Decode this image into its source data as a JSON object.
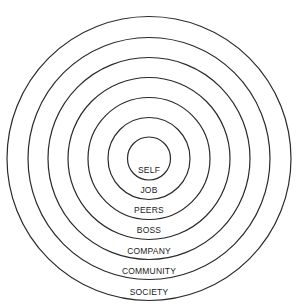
{
  "diagram": {
    "type": "concentric-circles",
    "center": {
      "x": 149,
      "y": 158.5
    },
    "rings": [
      {
        "label": "SELF",
        "radius": 21.5,
        "label_y": 173
      },
      {
        "label": "JOB",
        "radius": 41,
        "label_y": 193
      },
      {
        "label": "PEERS",
        "radius": 61,
        "label_y": 213
      },
      {
        "label": "BOSS",
        "radius": 81,
        "label_y": 233
      },
      {
        "label": "COMPANY",
        "radius": 101,
        "label_y": 253.5
      },
      {
        "label": "COMMUNITY",
        "radius": 121,
        "label_y": 274
      },
      {
        "label": "SOCIETY",
        "radius": 142,
        "label_y": 295
      }
    ],
    "colors": {
      "stroke": "#2a2a2a",
      "text": "#1a1a1a",
      "background": "#ffffff"
    }
  }
}
